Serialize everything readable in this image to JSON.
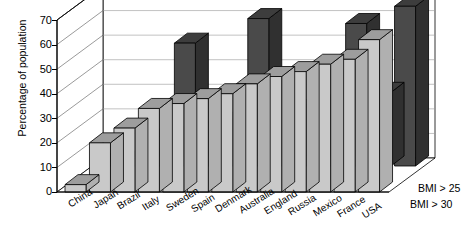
{
  "chart_data": {
    "type": "bar",
    "title": "Women",
    "xlabel": "",
    "ylabel": "Percentage of population",
    "ylim": [
      0,
      70
    ],
    "yticks": [
      0,
      10,
      20,
      30,
      40,
      50,
      60,
      70
    ],
    "grid": true,
    "three_d": true,
    "legend_position": "right-bottom",
    "categories": [
      "China",
      "Japan",
      "Brazil",
      "Italy",
      "Sweden",
      "Spain",
      "Denmark",
      "Australia",
      "England",
      "Russia",
      "Mexico",
      "France",
      "USA"
    ],
    "series": [
      {
        "name": "BMI > 25",
        "color": "#c9c9c9",
        "values": [
          3,
          20,
          26,
          34,
          36,
          38,
          40,
          44,
          47,
          49,
          52,
          54,
          62
        ]
      },
      {
        "name": "BMI > 30",
        "color": "#4a4a4a",
        "values": [
          2,
          3,
          12,
          50,
          15,
          19,
          60,
          21,
          24,
          26,
          58,
          30,
          65
        ]
      }
    ]
  },
  "axis": {
    "ylabel": "Percentage of population",
    "tick_labels": [
      "70",
      "60",
      "50",
      "40",
      "30",
      "20",
      "10",
      "0"
    ]
  },
  "legend": {
    "upper_label": "BMI > 25",
    "lower_label": "BMI > 30"
  },
  "panel": {
    "title": "Women"
  }
}
